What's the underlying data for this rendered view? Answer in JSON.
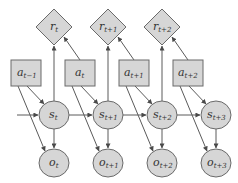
{
  "diagram": {
    "type": "POMDP dynamic Bayesian network",
    "colors": {
      "node_fill": "#d6d6d6",
      "node_stroke": "#6a6a6a",
      "edge": "#5a5a5a",
      "text": "#333333"
    },
    "rewards": [
      {
        "id": "r_t",
        "base": "r",
        "sub": "t"
      },
      {
        "id": "r_t+1",
        "base": "r",
        "sub": "t+1"
      },
      {
        "id": "r_t+2",
        "base": "r",
        "sub": "t+2"
      }
    ],
    "actions": [
      {
        "id": "a_t-1",
        "base": "a",
        "sub": "t−1"
      },
      {
        "id": "a_t",
        "base": "a",
        "sub": "t"
      },
      {
        "id": "a_t+1",
        "base": "a",
        "sub": "t+1"
      },
      {
        "id": "a_t+2",
        "base": "a",
        "sub": "t+2"
      }
    ],
    "states": [
      {
        "id": "s_t",
        "base": "s",
        "sub": "t"
      },
      {
        "id": "s_t+1",
        "base": "s",
        "sub": "t+1"
      },
      {
        "id": "s_t+2",
        "base": "s",
        "sub": "t+2"
      },
      {
        "id": "s_t+3",
        "base": "s",
        "sub": "t+3"
      }
    ],
    "observations": [
      {
        "id": "o_t",
        "base": "o",
        "sub": "t"
      },
      {
        "id": "o_t+1",
        "base": "o",
        "sub": "t+1"
      },
      {
        "id": "o_t+2",
        "base": "o",
        "sub": "t+2"
      },
      {
        "id": "o_t+3",
        "base": "o",
        "sub": "t+3"
      }
    ],
    "edges": [
      [
        "in",
        "s_t"
      ],
      [
        "s_t",
        "s_t+1"
      ],
      [
        "s_t+1",
        "s_t+2"
      ],
      [
        "s_t+2",
        "s_t+3"
      ],
      [
        "s_t",
        "r_t"
      ],
      [
        "s_t+1",
        "r_t+1"
      ],
      [
        "s_t+2",
        "r_t+2"
      ],
      [
        "a_t",
        "r_t"
      ],
      [
        "a_t+1",
        "r_t+1"
      ],
      [
        "a_t+2",
        "r_t+2"
      ],
      [
        "a_t-1",
        "s_t"
      ],
      [
        "a_t",
        "s_t+1"
      ],
      [
        "a_t+1",
        "s_t+2"
      ],
      [
        "a_t+2",
        "s_t+3"
      ],
      [
        "a_t-1",
        "o_t"
      ],
      [
        "a_t",
        "o_t+1"
      ],
      [
        "a_t+1",
        "o_t+2"
      ],
      [
        "a_t+2",
        "o_t+3"
      ],
      [
        "s_t",
        "o_t"
      ],
      [
        "s_t+1",
        "o_t+1"
      ],
      [
        "s_t+2",
        "o_t+2"
      ],
      [
        "s_t+3",
        "o_t+3"
      ]
    ]
  }
}
